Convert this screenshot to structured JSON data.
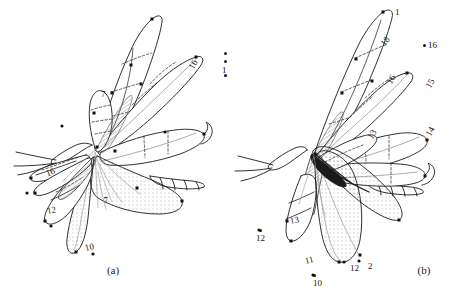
{
  "figure": {
    "background_color": "#ffffff",
    "ink_color": "#1a1a1a",
    "panels": [
      {
        "id": "a",
        "caption": "(a)",
        "caption_x": 113,
        "caption_y": 268,
        "labels": [
          {
            "text": "1",
            "x": 222,
            "y": 66,
            "rotation": 0,
            "dot": false
          },
          {
            "text": "16",
            "x": 189,
            "y": 60,
            "rotation": -62,
            "dot": false
          },
          {
            "text": "16",
            "x": 46,
            "y": 168,
            "rotation": -20,
            "dot": false
          },
          {
            "text": "7",
            "x": 101,
            "y": 90,
            "rotation": 0,
            "dot": false
          },
          {
            "text": "7",
            "x": 104,
            "y": 196,
            "rotation": -12,
            "dot": false
          },
          {
            "text": "12",
            "x": 47,
            "y": 206,
            "rotation": -10,
            "dot": false
          },
          {
            "text": "10",
            "x": 85,
            "y": 243,
            "rotation": -15,
            "dot": false
          }
        ],
        "marker_dots": [
          {
            "x": 224,
            "y": 52
          },
          {
            "x": 224,
            "y": 60
          },
          {
            "x": 224,
            "y": 74
          },
          {
            "x": 62,
            "y": 126
          },
          {
            "x": 165,
            "y": 132
          },
          {
            "x": 134,
            "y": 190
          },
          {
            "x": 27,
            "y": 193
          },
          {
            "x": 51,
            "y": 226
          },
          {
            "x": 93,
            "y": 254
          }
        ]
      },
      {
        "id": "b",
        "caption": "(b)",
        "caption_x": 394,
        "caption_y": 268,
        "labels": [
          {
            "text": "1",
            "x": 395,
            "y": 11,
            "rotation": 0,
            "dot": false
          },
          {
            "text": "18",
            "x": 381,
            "y": 40,
            "rotation": -52,
            "dot": false
          },
          {
            "text": "16",
            "x": 387,
            "y": 78,
            "rotation": -58,
            "dot": false
          },
          {
            "text": "15",
            "x": 426,
            "y": 82,
            "rotation": -62,
            "dot": false
          },
          {
            "text": "14",
            "x": 426,
            "y": 130,
            "rotation": -62,
            "dot": false
          },
          {
            "text": "13",
            "x": 368,
            "y": 133,
            "rotation": -58,
            "dot": false
          },
          {
            "text": "13",
            "x": 290,
            "y": 219,
            "rotation": -10,
            "dot": false
          },
          {
            "text": "12",
            "x": 262,
            "y": 237,
            "rotation": 0,
            "dot": true
          },
          {
            "text": "16",
            "x": 428,
            "y": 44,
            "rotation": 0,
            "dot": true
          },
          {
            "text": "11",
            "x": 305,
            "y": 259,
            "rotation": -14,
            "dot": false
          },
          {
            "text": "12",
            "x": 350,
            "y": 267,
            "rotation": 0,
            "dot": false
          },
          {
            "text": "10",
            "x": 313,
            "y": 282,
            "rotation": 0,
            "dot": true
          },
          {
            "text": "2",
            "x": 368,
            "y": 265,
            "rotation": 0,
            "dot": false
          }
        ],
        "marker_dots": [
          {
            "x": 391,
            "y": 22
          },
          {
            "x": 423,
            "y": 45
          },
          {
            "x": 259,
            "y": 230
          },
          {
            "x": 310,
            "y": 275
          },
          {
            "x": 344,
            "y": 262
          },
          {
            "x": 359,
            "y": 261
          }
        ]
      }
    ]
  }
}
